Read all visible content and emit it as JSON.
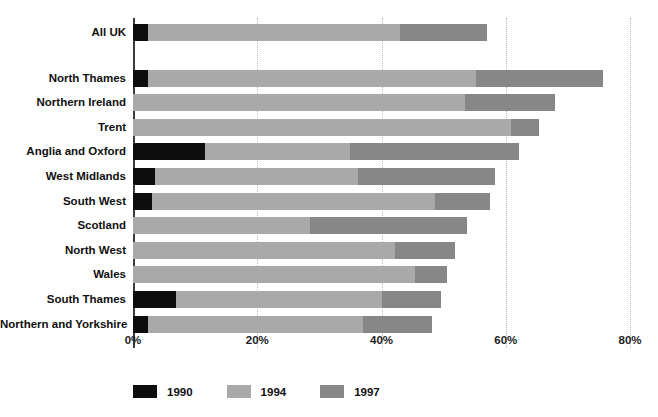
{
  "chart_data": {
    "type": "bar",
    "orientation": "horizontal",
    "stacked": true,
    "title": "",
    "subtitle": "",
    "xlabel": "",
    "ylabel": "",
    "xlim": [
      0,
      80
    ],
    "xticks": [
      0,
      20,
      40,
      60,
      80
    ],
    "xticklabels": [
      "0%",
      "20%",
      "40%",
      "60%",
      "80%"
    ],
    "grid": true,
    "grid_axis": "x",
    "legend_position": "bottom",
    "categories": [
      "All UK",
      "North Thames",
      "Northern Ireland",
      "Trent",
      "Anglia and Oxford",
      "West Midlands",
      "South West",
      "Scotland",
      "North West",
      "Wales",
      "South Thames",
      "Northern and Yorkshire"
    ],
    "series": [
      {
        "name": "1990",
        "color": "#0d0d0d",
        "values": [
          2.4,
          2.4,
          0.0,
          0.0,
          11.6,
          3.5,
          3.1,
          0.0,
          0.0,
          0.0,
          6.9,
          2.4
        ]
      },
      {
        "name": "1994",
        "color": "#a9a9a9",
        "values": [
          40.6,
          52.8,
          53.4,
          60.8,
          23.3,
          32.7,
          45.5,
          28.5,
          42.2,
          45.4,
          33.2,
          34.6
        ]
      },
      {
        "name": "1997",
        "color": "#878787",
        "values": [
          14.0,
          20.4,
          14.5,
          4.5,
          27.3,
          22.0,
          8.9,
          25.3,
          9.6,
          5.1,
          9.5,
          11.1
        ]
      }
    ],
    "cumulative_totals": [
      57.0,
      73.2,
      67.9,
      65.3,
      62.2,
      58.2,
      57.5,
      53.8,
      51.8,
      50.5,
      49.6,
      48.1
    ],
    "row_gaps_after": [
      0
    ]
  },
  "legend": {
    "items": [
      {
        "label": "1990",
        "color": "#0d0d0d"
      },
      {
        "label": "1994",
        "color": "#a9a9a9"
      },
      {
        "label": "1997",
        "color": "#878787"
      }
    ]
  },
  "axis": {
    "zero_color": "#3b3b3b",
    "grid_color": "#b9b9b9"
  }
}
